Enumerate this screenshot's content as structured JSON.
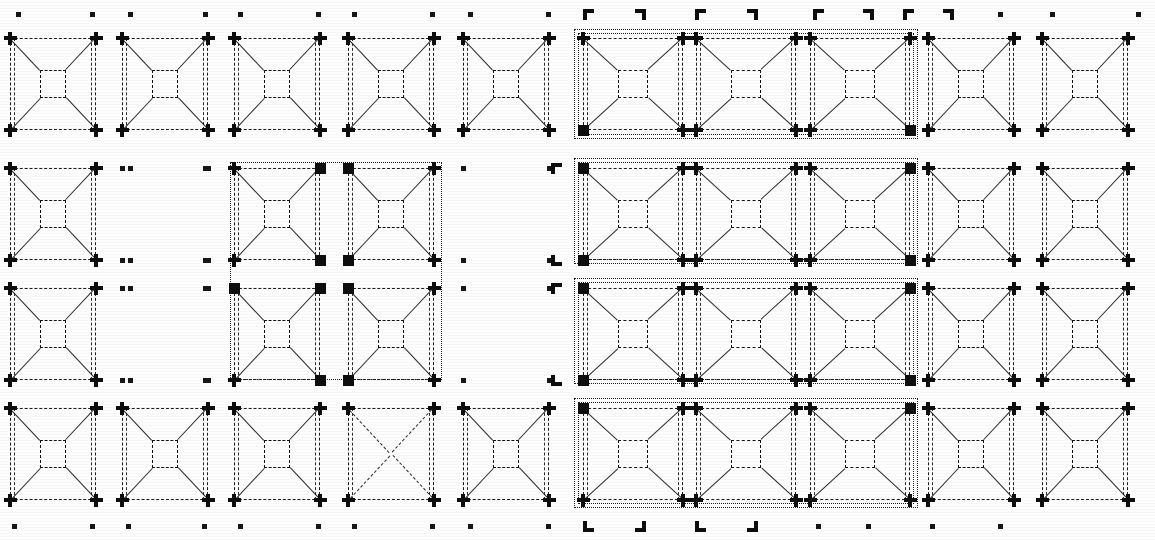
{
  "sheet": {
    "title": "Panel Layout Grid",
    "width": 1155,
    "height": 540,
    "background": "#fdfdfd",
    "ink": "#111111",
    "columns": 10,
    "rows": 4,
    "description": "Scanned monochrome technical drawing: a 10 x 4 array of square panel symbols, each a dashed outer square with a small dashed inner square joined by four diagonals, with registration markers at every node."
  },
  "geometry": {
    "col_x": [
      10,
      122,
      234,
      348,
      463,
      583,
      696,
      810,
      928,
      1042
    ],
    "col_w": [
      86,
      86,
      86,
      86,
      86,
      100,
      100,
      100,
      86,
      86
    ],
    "row_y": [
      38,
      168,
      288,
      408
    ],
    "row_h": [
      92,
      92,
      92,
      92
    ],
    "edge_marker_top_y": 14,
    "edge_marker_bottom_y": 526,
    "inner_square_ratio": 0.3
  },
  "markers": {
    "legend": [
      {
        "id": "plus",
        "name": "cross-marker",
        "meaning": "standard node"
      },
      {
        "id": "square",
        "name": "filled-square-marker",
        "meaning": "group corner node"
      },
      {
        "id": "dot",
        "name": "dot-marker",
        "meaning": "vacant node"
      },
      {
        "id": "bracket",
        "name": "corner-bracket-marker",
        "meaning": "registration target"
      }
    ]
  },
  "cells": [
    {
      "r": 0,
      "c": 0,
      "state": "panel",
      "corner": "plus"
    },
    {
      "r": 0,
      "c": 1,
      "state": "panel",
      "corner": "plus"
    },
    {
      "r": 0,
      "c": 2,
      "state": "panel",
      "corner": "plus"
    },
    {
      "r": 0,
      "c": 3,
      "state": "panel",
      "corner": "plus"
    },
    {
      "r": 0,
      "c": 4,
      "state": "panel",
      "corner": "plus"
    },
    {
      "r": 0,
      "c": 5,
      "state": "panel",
      "corner": "plus",
      "corner_bl": "square"
    },
    {
      "r": 0,
      "c": 6,
      "state": "panel",
      "corner": "plus"
    },
    {
      "r": 0,
      "c": 7,
      "state": "panel",
      "corner": "plus",
      "corner_br": "square"
    },
    {
      "r": 0,
      "c": 8,
      "state": "panel",
      "corner": "plus"
    },
    {
      "r": 0,
      "c": 9,
      "state": "panel",
      "corner": "plus"
    },
    {
      "r": 1,
      "c": 0,
      "state": "panel",
      "corner": "plus"
    },
    {
      "r": 1,
      "c": 1,
      "state": "empty",
      "corner": "dot"
    },
    {
      "r": 1,
      "c": 2,
      "state": "panel",
      "corner": "plus",
      "corner_tr": "square",
      "corner_br": "square"
    },
    {
      "r": 1,
      "c": 3,
      "state": "panel",
      "corner": "plus",
      "corner_tl": "square",
      "corner_bl": "square"
    },
    {
      "r": 1,
      "c": 4,
      "state": "empty",
      "corner": "dot"
    },
    {
      "r": 1,
      "c": 5,
      "state": "panel",
      "corner": "plus",
      "corner_tl": "square",
      "corner_bl": "square"
    },
    {
      "r": 1,
      "c": 6,
      "state": "panel",
      "corner": "plus"
    },
    {
      "r": 1,
      "c": 7,
      "state": "panel",
      "corner": "plus",
      "corner_tr": "square",
      "corner_br": "square"
    },
    {
      "r": 1,
      "c": 8,
      "state": "panel",
      "corner": "plus"
    },
    {
      "r": 1,
      "c": 9,
      "state": "panel",
      "corner": "plus"
    },
    {
      "r": 2,
      "c": 0,
      "state": "panel",
      "corner": "plus"
    },
    {
      "r": 2,
      "c": 1,
      "state": "empty",
      "corner": "dot"
    },
    {
      "r": 2,
      "c": 2,
      "state": "panel",
      "corner": "plus",
      "corner_tl": "square",
      "corner_tr": "square",
      "corner_br": "square"
    },
    {
      "r": 2,
      "c": 3,
      "state": "panel",
      "corner": "plus",
      "corner_tl": "square",
      "corner_bl": "square"
    },
    {
      "r": 2,
      "c": 4,
      "state": "empty",
      "corner": "dot"
    },
    {
      "r": 2,
      "c": 5,
      "state": "panel",
      "corner": "plus",
      "corner_tl": "square",
      "corner_bl": "square"
    },
    {
      "r": 2,
      "c": 6,
      "state": "panel",
      "corner": "plus"
    },
    {
      "r": 2,
      "c": 7,
      "state": "panel",
      "corner": "plus",
      "corner_tr": "square",
      "corner_br": "square"
    },
    {
      "r": 2,
      "c": 8,
      "state": "panel",
      "corner": "plus"
    },
    {
      "r": 2,
      "c": 9,
      "state": "panel",
      "corner": "plus"
    },
    {
      "r": 3,
      "c": 0,
      "state": "panel",
      "corner": "plus"
    },
    {
      "r": 3,
      "c": 1,
      "state": "panel",
      "corner": "plus"
    },
    {
      "r": 3,
      "c": 2,
      "state": "panel",
      "corner": "plus"
    },
    {
      "r": 3,
      "c": 3,
      "state": "xonly",
      "corner": "plus"
    },
    {
      "r": 3,
      "c": 4,
      "state": "panel",
      "corner": "plus"
    },
    {
      "r": 3,
      "c": 5,
      "state": "panel",
      "corner": "plus",
      "corner_tl": "square"
    },
    {
      "r": 3,
      "c": 6,
      "state": "panel",
      "corner": "plus"
    },
    {
      "r": 3,
      "c": 7,
      "state": "panel",
      "corner": "plus",
      "corner_tr": "square"
    },
    {
      "r": 3,
      "c": 8,
      "state": "panel",
      "corner": "plus"
    },
    {
      "r": 3,
      "c": 9,
      "state": "panel",
      "corner": "plus"
    }
  ],
  "groups": [
    {
      "id": "grp-top-mid",
      "name": "group-row0-cols5-7",
      "x": 578,
      "y": 33,
      "w": 336,
      "h": 102,
      "double": true
    },
    {
      "id": "grp-mid-mid",
      "name": "group-rows1-2-cols5-7",
      "x": 578,
      "y": 162,
      "w": 336,
      "h": 98,
      "double": true
    },
    {
      "id": "grp-mid-mid2",
      "name": "group-row2-cols5-7",
      "x": 578,
      "y": 282,
      "w": 336,
      "h": 98,
      "double": true
    },
    {
      "id": "grp-bot-mid",
      "name": "group-row3-cols5-7",
      "x": 578,
      "y": 402,
      "w": 336,
      "h": 102,
      "double": true
    },
    {
      "id": "grp-quad",
      "name": "group-rows1-2-cols2-3",
      "x": 230,
      "y": 162,
      "w": 212,
      "h": 218,
      "double": false
    }
  ],
  "edge_markers": {
    "top": [
      {
        "x": 18,
        "type": "dot"
      },
      {
        "x": 92,
        "type": "dot"
      },
      {
        "x": 130,
        "type": "dot"
      },
      {
        "x": 205,
        "type": "dot"
      },
      {
        "x": 240,
        "type": "dot"
      },
      {
        "x": 318,
        "type": "dot"
      },
      {
        "x": 354,
        "type": "dot"
      },
      {
        "x": 432,
        "type": "dot"
      },
      {
        "x": 470,
        "type": "dot"
      },
      {
        "x": 548,
        "type": "dot"
      },
      {
        "x": 588,
        "type": "bracket-tl"
      },
      {
        "x": 640,
        "type": "bracket-tr"
      },
      {
        "x": 700,
        "type": "bracket-tl"
      },
      {
        "x": 752,
        "type": "bracket-tr"
      },
      {
        "x": 818,
        "type": "bracket-tl"
      },
      {
        "x": 868,
        "type": "bracket-tr"
      },
      {
        "x": 908,
        "type": "bracket-tl"
      },
      {
        "x": 948,
        "type": "bracket-tr"
      },
      {
        "x": 1000,
        "type": "dot"
      },
      {
        "x": 1052,
        "type": "dot"
      },
      {
        "x": 1138,
        "type": "dot"
      }
    ],
    "bottom": [
      {
        "x": 14,
        "type": "dot"
      },
      {
        "x": 92,
        "type": "dot"
      },
      {
        "x": 128,
        "type": "dot"
      },
      {
        "x": 204,
        "type": "dot"
      },
      {
        "x": 240,
        "type": "dot"
      },
      {
        "x": 318,
        "type": "dot"
      },
      {
        "x": 354,
        "type": "dot"
      },
      {
        "x": 432,
        "type": "dot"
      },
      {
        "x": 470,
        "type": "dot"
      },
      {
        "x": 548,
        "type": "dot"
      },
      {
        "x": 588,
        "type": "bracket-bl"
      },
      {
        "x": 640,
        "type": "bracket-br"
      },
      {
        "x": 700,
        "type": "bracket-bl"
      },
      {
        "x": 752,
        "type": "bracket-br"
      },
      {
        "x": 818,
        "type": "dot"
      },
      {
        "x": 868,
        "type": "dot"
      },
      {
        "x": 932,
        "type": "dot"
      },
      {
        "x": 1000,
        "type": "dot"
      }
    ],
    "left": [
      {
        "y": 168,
        "type": "dot"
      },
      {
        "y": 260,
        "type": "dot"
      },
      {
        "y": 288,
        "type": "dot"
      },
      {
        "y": 380,
        "type": "dot"
      }
    ],
    "gutter": [
      {
        "x": 556,
        "y": 168,
        "type": "bracket-tl"
      },
      {
        "x": 556,
        "y": 260,
        "type": "bracket-bl"
      },
      {
        "x": 556,
        "y": 288,
        "type": "bracket-tl"
      },
      {
        "x": 556,
        "y": 380,
        "type": "bracket-bl"
      }
    ]
  }
}
